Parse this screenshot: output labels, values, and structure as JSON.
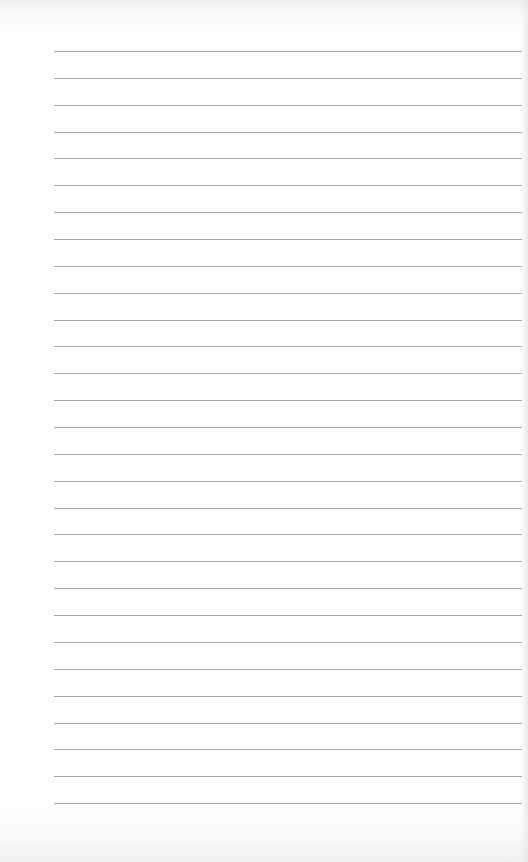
{
  "page": {
    "type": "lined-notebook-page",
    "background_color": "#ffffff",
    "line_color": "#9a9a9a",
    "line_count": 29,
    "first_line_y": 51,
    "line_spacing": 26.86,
    "line_left": 54,
    "line_right": 522
  }
}
